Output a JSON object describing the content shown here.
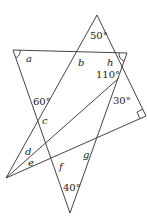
{
  "diagram": {
    "type": "geometry-angle-figure",
    "line_color": "#444444",
    "text_color": "#222222",
    "vertices": {
      "top_apex": [
        97,
        15
      ],
      "top_left": [
        13,
        50
      ],
      "top_right": [
        127,
        53
      ],
      "right_angle_corner": [
        146,
        116
      ],
      "left_vertex": [
        6,
        178
      ],
      "bottom_apex": [
        70,
        213
      ],
      "cross_110": [
        119,
        78
      ]
    },
    "given_angles": {
      "top": "50°",
      "crossing": "110°",
      "left": "60°",
      "right": "30°",
      "bottom": "40°"
    },
    "unknown_angles": {
      "a": "a",
      "b": "b",
      "h": "h",
      "c": "c",
      "d": "d",
      "e": "e",
      "f": "f",
      "g": "g"
    },
    "right_angle_marker": true
  }
}
